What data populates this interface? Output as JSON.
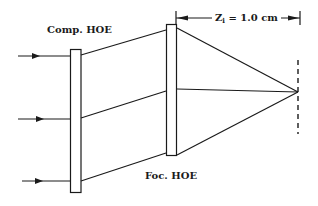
{
  "diagram": {
    "labels": {
      "compensation_hoe": "Comp. HOE",
      "focusing_hoe": "Foc. HOE",
      "distance_symbol": "Z",
      "distance_subscript": "i",
      "distance_value": " = 1.0 cm"
    },
    "elements": {
      "comp_hoe_plate": {
        "x": 70,
        "y": 49,
        "width": 11,
        "height": 144
      },
      "foc_hoe_plate": {
        "x": 166,
        "y": 24,
        "width": 11,
        "height": 132
      },
      "focal_point": {
        "x": 298,
        "y": 92
      },
      "image_plane_dashed": {
        "x": 298,
        "y1": 60,
        "y2": 134
      },
      "input_rays_y": [
        56,
        119,
        181
      ],
      "dimension_line": {
        "y": 18,
        "x1": 176,
        "x2": 300
      }
    },
    "colors": {
      "stroke": "#1a1a1a",
      "background": "#ffffff"
    }
  }
}
